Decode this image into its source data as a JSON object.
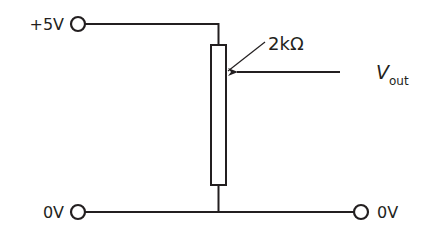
{
  "diagram": {
    "type": "potential-divider-circuit",
    "colors": {
      "line": "#231f20",
      "background": "#ffffff"
    },
    "terminals": {
      "top_left": {
        "label": "+5V"
      },
      "bottom_left": {
        "label": "0V"
      },
      "bottom_right": {
        "label": "0V"
      }
    },
    "resistor": {
      "label": "2kΩ",
      "kind": "variable-potentiometer"
    },
    "output": {
      "label_main": "V",
      "label_sub": "out"
    }
  }
}
